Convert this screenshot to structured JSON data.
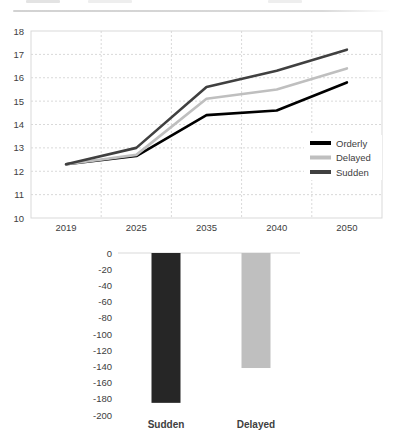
{
  "colors": {
    "background": "#ffffff",
    "divider": "#d9d9d9",
    "grid": "#d9d9d9",
    "plot_border": "#d9d9d9",
    "axis_text": "#404040"
  },
  "chart_data": [
    {
      "type": "line",
      "title": "",
      "categories": [
        "2019",
        "2025",
        "2035",
        "2040",
        "2050"
      ],
      "series": [
        {
          "name": "Orderly",
          "color": "#000000",
          "values": [
            12.3,
            12.65,
            14.4,
            14.6,
            15.8
          ]
        },
        {
          "name": "Delayed",
          "color": "#bfbfbf",
          "values": [
            12.3,
            12.7,
            15.1,
            15.5,
            16.4
          ]
        },
        {
          "name": "Sudden",
          "color": "#404040",
          "values": [
            12.3,
            13.0,
            15.6,
            16.3,
            17.2
          ]
        }
      ],
      "xlabel": "",
      "ylabel": "",
      "ylim": [
        10,
        18
      ],
      "ytick_step": 1,
      "yticks": [
        10,
        11,
        12,
        13,
        14,
        15,
        16,
        17,
        18
      ],
      "grid": true,
      "grid_style": "dashed",
      "legend_position": "inside-right",
      "legend": [
        "Orderly",
        "Delayed",
        "Sudden"
      ]
    },
    {
      "type": "bar",
      "title": "",
      "categories": [
        "Sudden",
        "Delayed"
      ],
      "values": [
        -185,
        -142
      ],
      "colors": [
        "#262626",
        "#bfbfbf"
      ],
      "xlabel": "",
      "ylabel": "",
      "ylim": [
        -200,
        0
      ],
      "ytick_step": -20,
      "yticks": [
        0,
        -20,
        -40,
        -60,
        -80,
        -100,
        -120,
        -140,
        -160,
        -180,
        -200
      ],
      "grid": false,
      "legend_position": "none"
    }
  ]
}
